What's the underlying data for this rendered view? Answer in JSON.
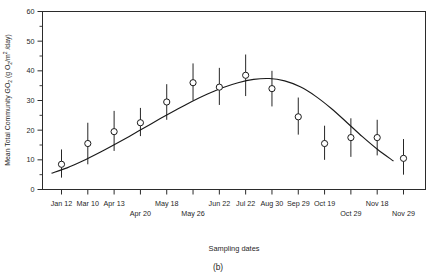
{
  "figure": {
    "panel_label": "(b)",
    "xlabel": "Sampling dates",
    "ylabel_main": "Mean Total Community ",
    "ylabel_g": "GO",
    "ylabel_g_sub": "2",
    "ylabel_units_open": " (g O",
    "ylabel_units_sub1": "2",
    "ylabel_units_mid": "/m",
    "ylabel_units_sup": "2",
    "ylabel_units_close": " /day)"
  },
  "chart_data": {
    "type": "scatter",
    "title": "",
    "xlabel": "Sampling dates",
    "ylabel": "Mean Total Community GO2 (g O2/m2 /day)",
    "ylim": [
      0,
      60
    ],
    "ytick_values": [
      0,
      10,
      20,
      30,
      40,
      50,
      60
    ],
    "ytick_labels": [
      "0",
      "10",
      "20",
      "30",
      "40",
      "50",
      "60"
    ],
    "yminor_values": [
      5,
      15,
      25,
      35,
      45,
      55
    ],
    "grid": false,
    "legend": "none",
    "marker_style": "open-circle",
    "error_bars": "vertical",
    "fit_line": "smoothed seasonal curve",
    "categories": [
      "Jan 12",
      "Mar 10",
      "Apr 13",
      "Apr 20",
      "May 18",
      "May 26",
      "Jun 22",
      "Jul 22",
      "Aug 30",
      "Sep 29",
      "Oct 19",
      "Oct 29",
      "Nov 18",
      "Nov 29"
    ],
    "xtick_rows": [
      [
        {
          "label": "Jan 12",
          "index": 0
        },
        {
          "label": "Mar 10",
          "index": 1
        },
        {
          "label": "Apr 13",
          "index": 2
        },
        {
          "label": "May 18",
          "index": 4
        },
        {
          "label": "Jun 22",
          "index": 6
        },
        {
          "label": "Jul 22",
          "index": 7
        },
        {
          "label": "Aug 30",
          "index": 8
        },
        {
          "label": "Sep 29",
          "index": 9
        },
        {
          "label": "Oct 19",
          "index": 10
        },
        {
          "label": "Nov 18",
          "index": 12
        }
      ],
      [
        {
          "label": "Apr 20",
          "index": 3
        },
        {
          "label": "May 26",
          "index": 5
        },
        {
          "label": "Oct 29",
          "index": 11
        },
        {
          "label": "Nov 29",
          "index": 13
        }
      ]
    ],
    "points": [
      {
        "x": "Jan 12",
        "index": 0,
        "y": 8.5,
        "err_low": 4.0,
        "err_high": 13.5
      },
      {
        "x": "Mar 10",
        "index": 1,
        "y": 15.5,
        "err_low": 8.5,
        "err_high": 22.5
      },
      {
        "x": "Apr 13",
        "index": 2,
        "y": 19.5,
        "err_low": 13.0,
        "err_high": 26.5
      },
      {
        "x": "Apr 20",
        "index": 3,
        "y": 22.5,
        "err_low": 18.0,
        "err_high": 27.5
      },
      {
        "x": "May 18",
        "index": 4,
        "y": 29.5,
        "err_low": 23.5,
        "err_high": 35.5
      },
      {
        "x": "May 26",
        "index": 5,
        "y": 36.0,
        "err_low": 30.0,
        "err_high": 42.5
      },
      {
        "x": "Jun 22",
        "index": 6,
        "y": 34.5,
        "err_low": 28.5,
        "err_high": 41.0
      },
      {
        "x": "Jul 22",
        "index": 7,
        "y": 38.5,
        "err_low": 31.5,
        "err_high": 45.5
      },
      {
        "x": "Aug 30",
        "index": 8,
        "y": 34.0,
        "err_low": 28.0,
        "err_high": 40.0
      },
      {
        "x": "Sep 29",
        "index": 9,
        "y": 24.5,
        "err_low": 18.5,
        "err_high": 31.0
      },
      {
        "x": "Oct 19",
        "index": 10,
        "y": 15.5,
        "err_low": 10.0,
        "err_high": 21.5
      },
      {
        "x": "Oct 29",
        "index": 11,
        "y": 17.5,
        "err_low": 11.0,
        "err_high": 24.0
      },
      {
        "x": "Nov 18",
        "index": 12,
        "y": 17.5,
        "err_low": 11.5,
        "err_high": 23.5
      },
      {
        "x": "Nov 29",
        "index": 13,
        "y": 10.5,
        "err_low": 5.0,
        "err_high": 17.0
      }
    ],
    "fit_curve": [
      {
        "t": 0.0,
        "y": 5.5
      },
      {
        "t": 0.05,
        "y": 7.3
      },
      {
        "t": 0.1,
        "y": 9.6
      },
      {
        "t": 0.15,
        "y": 12.2
      },
      {
        "t": 0.2,
        "y": 15.0
      },
      {
        "t": 0.25,
        "y": 17.9
      },
      {
        "t": 0.3,
        "y": 20.9
      },
      {
        "t": 0.35,
        "y": 23.9
      },
      {
        "t": 0.4,
        "y": 26.8
      },
      {
        "t": 0.45,
        "y": 29.6
      },
      {
        "t": 0.5,
        "y": 32.1
      },
      {
        "t": 0.55,
        "y": 34.3
      },
      {
        "t": 0.6,
        "y": 36.0
      },
      {
        "t": 0.65,
        "y": 37.1
      },
      {
        "t": 0.7,
        "y": 37.4
      },
      {
        "t": 0.75,
        "y": 36.6
      },
      {
        "t": 0.8,
        "y": 34.6
      },
      {
        "t": 0.85,
        "y": 31.4
      },
      {
        "t": 0.9,
        "y": 27.3
      },
      {
        "t": 0.95,
        "y": 22.6
      },
      {
        "t": 1.0,
        "y": 17.8
      },
      {
        "t": 1.05,
        "y": 13.4
      },
      {
        "t": 1.1,
        "y": 9.6
      }
    ]
  }
}
